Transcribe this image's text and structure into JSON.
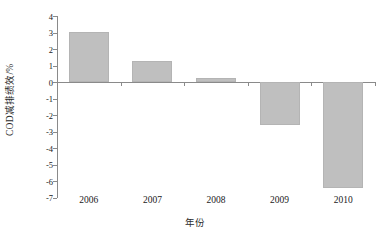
{
  "chart_data": {
    "type": "bar",
    "title": "",
    "xlabel": "年份",
    "ylabel": "COD减排绩效/%",
    "categories": [
      "2006",
      "2007",
      "2008",
      "2009",
      "2010"
    ],
    "values": [
      3.05,
      1.25,
      0.25,
      -2.6,
      -6.4
    ],
    "ylim": [
      -7,
      4
    ],
    "ytick_labels": [
      "4",
      "3",
      "2",
      "1",
      "0",
      "-1",
      "-2",
      "-3",
      "-4",
      "-5",
      "-6",
      "-7"
    ],
    "ytick_values": [
      4,
      3,
      2,
      1,
      0,
      -1,
      -2,
      -3,
      -4,
      -5,
      -6,
      -7
    ],
    "grid": false,
    "legend": null,
    "bar_color": "#bfbfbf",
    "axis_color": "#8a8a8a"
  }
}
